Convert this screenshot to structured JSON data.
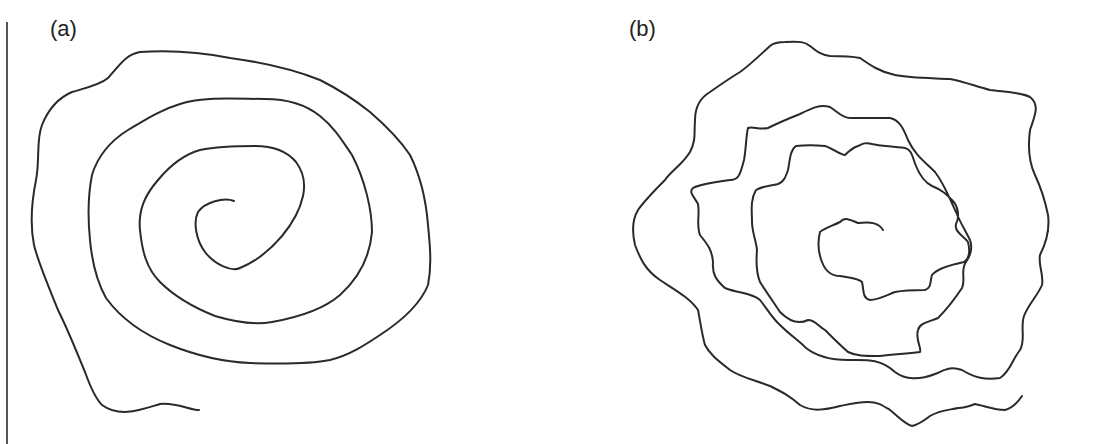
{
  "figure": {
    "panels": [
      {
        "label": "(a)",
        "description": "smooth hand-drawn spiral"
      },
      {
        "label": "(b)",
        "description": "irregular wavy hand-drawn spiral"
      }
    ]
  },
  "colors": {
    "stroke": "#2a2a2a",
    "background": "#ffffff",
    "border": "#555555"
  }
}
